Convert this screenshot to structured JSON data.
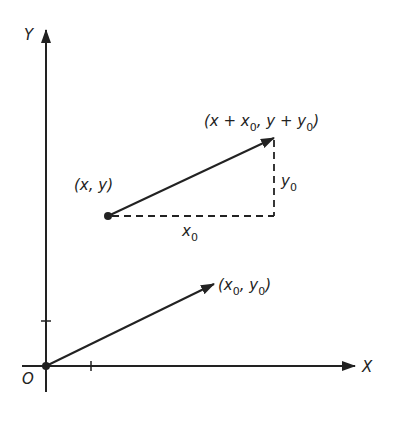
{
  "diagram": {
    "type": "vector-translation",
    "axes": {
      "x_label": "X",
      "y_label": "Y",
      "origin_label": "O"
    },
    "points": {
      "start": {
        "label": "(x, y)"
      },
      "end": {
        "label_prefix": "(x + x",
        "label_mid": ",   y + y",
        "label_suffix": ")",
        "sub": "0"
      },
      "vector_tip": {
        "label_prefix": "(x",
        "label_mid": ", y",
        "label_suffix": ")",
        "sub": "0"
      }
    },
    "components": {
      "x0": {
        "label": "x",
        "sub": "0"
      },
      "y0": {
        "label": "y",
        "sub": "0"
      }
    },
    "colors": {
      "ink": "#222222",
      "background": "#ffffff"
    }
  }
}
